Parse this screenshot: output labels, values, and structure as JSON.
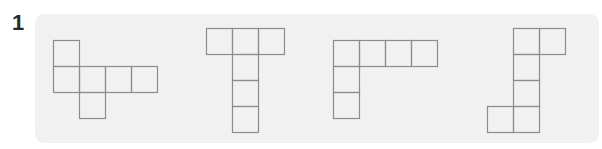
{
  "problem": {
    "number": "1",
    "panel_color": "#f1f1f1",
    "line_color": "#8c8c8c",
    "cell_size": 26,
    "figures": [
      {
        "name": "net-1",
        "origin": [
          53,
          40
        ],
        "cells": [
          [
            0,
            0
          ],
          [
            0,
            1
          ],
          [
            1,
            1
          ],
          [
            2,
            1
          ],
          [
            3,
            1
          ],
          [
            1,
            2
          ]
        ]
      },
      {
        "name": "net-2",
        "origin": [
          206,
          28
        ],
        "cells": [
          [
            0,
            0
          ],
          [
            1,
            0
          ],
          [
            2,
            0
          ],
          [
            1,
            1
          ],
          [
            1,
            2
          ],
          [
            1,
            3
          ]
        ]
      },
      {
        "name": "net-3",
        "origin": [
          333,
          40
        ],
        "cells": [
          [
            0,
            0
          ],
          [
            1,
            0
          ],
          [
            2,
            0
          ],
          [
            3,
            0
          ],
          [
            0,
            1
          ],
          [
            0,
            2
          ]
        ]
      },
      {
        "name": "net-4",
        "origin": [
          487,
          28
        ],
        "cells": [
          [
            1,
            0
          ],
          [
            2,
            0
          ],
          [
            1,
            1
          ],
          [
            1,
            2
          ],
          [
            0,
            3
          ],
          [
            1,
            3
          ]
        ]
      }
    ]
  }
}
